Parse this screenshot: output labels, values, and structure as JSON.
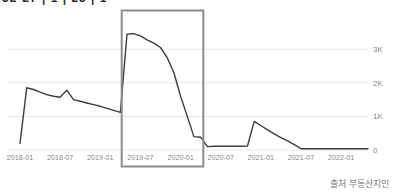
{
  "page": {
    "clipped_top_text": "32-27 | 1 | 23 | 1",
    "source_note": "출처 부동산지인"
  },
  "chart_data": {
    "type": "line",
    "title": "",
    "xlabel": "",
    "ylabel": "",
    "x": [
      "2018-01",
      "2018-02",
      "2018-03",
      "2018-04",
      "2018-05",
      "2018-06",
      "2018-07",
      "2018-08",
      "2018-09",
      "2018-10",
      "2018-11",
      "2018-12",
      "2019-01",
      "2019-02",
      "2019-03",
      "2019-04",
      "2019-05",
      "2019-06",
      "2019-07",
      "2019-08",
      "2019-09",
      "2019-10",
      "2019-11",
      "2019-12",
      "2020-01",
      "2020-02",
      "2020-03",
      "2020-04",
      "2020-05",
      "2020-06",
      "2020-07",
      "2020-08",
      "2020-09",
      "2020-10",
      "2020-11",
      "2020-12",
      "2021-01",
      "2021-02",
      "2021-03",
      "2021-04",
      "2021-05",
      "2021-06",
      "2021-07",
      "2021-08",
      "2021-09",
      "2021-10",
      "2021-11",
      "2021-12",
      "2022-01",
      "2022-02",
      "2022-03",
      "2022-04",
      "2022-05"
    ],
    "values": [
      200,
      1850,
      1800,
      1720,
      1650,
      1600,
      1570,
      1780,
      1500,
      1450,
      1400,
      1350,
      1300,
      1240,
      1180,
      1120,
      3450,
      3460,
      3400,
      3280,
      3180,
      3050,
      2750,
      2300,
      1600,
      1000,
      400,
      380,
      100,
      110,
      110,
      110,
      110,
      110,
      120,
      850,
      730,
      600,
      480,
      370,
      270,
      160,
      40,
      40,
      40,
      40,
      40,
      40,
      40,
      40,
      40,
      40,
      40
    ],
    "x_ticks": [
      "2018-01",
      "2018-07",
      "2019-01",
      "2019-07",
      "2020-01",
      "2020-07",
      "2021-01",
      "2021-07",
      "2022-01"
    ],
    "y_ticks": [
      {
        "label": "0",
        "value": 0
      },
      {
        "label": "1K",
        "value": 1000
      },
      {
        "label": "2K",
        "value": 2000
      },
      {
        "label": "3K",
        "value": 3000
      }
    ],
    "ylim": [
      0,
      3600
    ],
    "grid": true,
    "legend": "none",
    "y_axis_side": "right",
    "highlight_box": {
      "start_month_index": 15.2,
      "end_month_index": 27.4,
      "color": "#8c8c8c"
    },
    "colors": {
      "line": "#3d3d3d",
      "grid": "#e7e7e7",
      "labels": "#8a8a8a"
    }
  }
}
